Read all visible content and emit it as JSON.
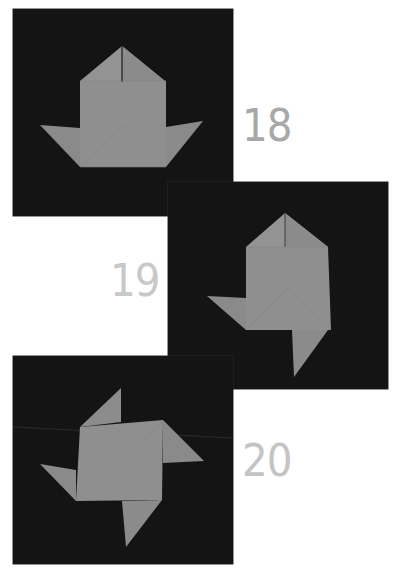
{
  "page": {
    "background": "#ffffff",
    "panel_background": "#141414",
    "paper_color": "#8f8f8f",
    "paper_shade": "#858585",
    "crease_color": "#7a7a7a"
  },
  "steps": [
    {
      "number": "18",
      "label_color": "#a8a8a8",
      "description": "Boat-like base with pointed top and two side flaps"
    },
    {
      "number": "19",
      "label_color": "#c8c8c8",
      "description": "Left flap folded out, bottom flap folded down"
    },
    {
      "number": "20",
      "label_color": "#c4c4c4",
      "description": "Completed pinwheel with four flaps"
    }
  ]
}
